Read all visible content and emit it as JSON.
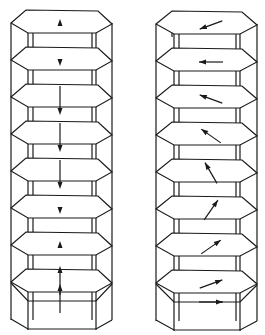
{
  "diagram": {
    "line_color": "#1a1a1a",
    "background": "#ffffff",
    "layer_count": 9,
    "layer_spacing_px": 37,
    "columns": [
      {
        "name": "left-column",
        "x_left": 11,
        "x_right": 112,
        "inner_left": 28,
        "inner_right": 96,
        "top_y": 23,
        "arrow_type": "collinear-vertical",
        "arrows": [
          {
            "layer": 1,
            "direction": "up",
            "length": "short"
          },
          {
            "layer": 2,
            "direction": "down",
            "length": "short"
          },
          {
            "layer": 3,
            "direction": "down",
            "length": "long"
          },
          {
            "layer": 4,
            "direction": "down",
            "length": "long"
          },
          {
            "layer": 5,
            "direction": "down",
            "length": "long"
          },
          {
            "layer": 6,
            "direction": "down",
            "length": "short"
          },
          {
            "layer": 7,
            "direction": "up",
            "length": "short"
          },
          {
            "layer": 8,
            "direction": "up",
            "length": "long"
          },
          {
            "layer": 9,
            "direction": "up",
            "length": "long"
          }
        ]
      },
      {
        "name": "right-column",
        "x_left": 156,
        "x_right": 257,
        "inner_left": 174,
        "inner_right": 240,
        "top_y": 24,
        "arrow_type": "rotating-in-plane",
        "arrows": [
          {
            "layer": 1,
            "angle_deg": 200
          },
          {
            "layer": 2,
            "angle_deg": 180
          },
          {
            "layer": 3,
            "angle_deg": 160
          },
          {
            "layer": 4,
            "angle_deg": 145
          },
          {
            "layer": 5,
            "angle_deg": 120
          },
          {
            "layer": 6,
            "angle_deg": 55
          },
          {
            "layer": 7,
            "angle_deg": 35
          },
          {
            "layer": 8,
            "angle_deg": 20
          },
          {
            "layer": 9,
            "angle_deg": 0
          }
        ]
      }
    ]
  }
}
